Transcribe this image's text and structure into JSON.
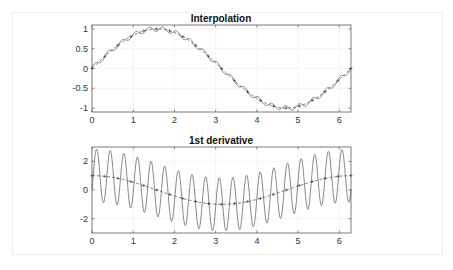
{
  "chart_data": [
    {
      "type": "line",
      "title": "Interpolation",
      "xlabel": "",
      "ylabel": "",
      "xlim": [
        0,
        6.2832
      ],
      "ylim": [
        -1.1,
        1.1
      ],
      "xticks": [
        0,
        1,
        2,
        3,
        4,
        5,
        6
      ],
      "yticks": [
        -1,
        -0.5,
        0,
        0.5,
        1
      ],
      "ytick_labels": [
        "-1",
        "-0.5",
        "0",
        "0.5",
        "1"
      ],
      "grid": true,
      "series": [
        {
          "name": "sampled sin(x) + high-frequency ripple",
          "style": "solid",
          "formula": "sin(x) + 0.1*sin(19x)"
        },
        {
          "name": "sin(x) interpolant",
          "style": "dashed with + markers",
          "formula": "sin(x)"
        }
      ]
    },
    {
      "type": "line",
      "title": "1st derivative",
      "xlabel": "",
      "ylabel": "",
      "xlim": [
        0,
        6.2832
      ],
      "ylim": [
        -3,
        3
      ],
      "xticks": [
        0,
        1,
        2,
        3,
        4,
        5,
        6
      ],
      "yticks": [
        -2,
        0,
        2
      ],
      "ytick_labels": [
        "-2",
        "0",
        "2"
      ],
      "grid": true,
      "series": [
        {
          "name": "derivative of rippled signal",
          "style": "solid",
          "formula": "cos(x) + 1.9*cos(19x) shifted",
          "peak_approx": 2.8,
          "trough_approx": -2.8
        },
        {
          "name": "cos(x)",
          "style": "dashed with + markers",
          "formula": "cos(x)"
        }
      ]
    }
  ],
  "plots": {
    "top": {
      "title": "Interpolation"
    },
    "bottom": {
      "title": "1st derivative"
    }
  }
}
